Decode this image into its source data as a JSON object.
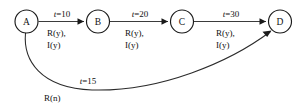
{
  "diagram": {
    "type": "state-transition-timing-diagram",
    "background_color": "#ffffff",
    "stroke_color": "#1a1a1a",
    "nodes": [
      {
        "id": "A",
        "label": "A",
        "cx": 26.5,
        "cy": 21.5,
        "r": 11.5
      },
      {
        "id": "B",
        "label": "B",
        "cx": 98.0,
        "cy": 21.5,
        "r": 11.5
      },
      {
        "id": "C",
        "label": "C",
        "cx": 182.0,
        "cy": 21.5,
        "r": 11.5
      },
      {
        "id": "D",
        "label": "D",
        "cx": 280.0,
        "cy": 21.5,
        "r": 11.5
      }
    ],
    "edges": [
      {
        "id": "a-to-b",
        "from": "A",
        "to": "B",
        "kind": "straight",
        "time_label": "t=10",
        "time_var": "t",
        "time_rest": "=10",
        "cond_line1": "R(y),",
        "cond_line2": "I(y)",
        "time_x": 62,
        "time_y": 17,
        "cond_x": 47,
        "cond_y1": 36,
        "cond_y2": 48
      },
      {
        "id": "b-to-c",
        "from": "B",
        "to": "C",
        "kind": "straight",
        "time_label": "t=20",
        "time_var": "t",
        "time_rest": "=20",
        "cond_line1": "R(y),",
        "cond_line2": "I(y)",
        "time_x": 140,
        "time_y": 17,
        "cond_x": 125,
        "cond_y1": 36,
        "cond_y2": 48
      },
      {
        "id": "c-to-d",
        "from": "C",
        "to": "D",
        "kind": "straight",
        "time_label": "t=30",
        "time_var": "t",
        "time_rest": "=30",
        "cond_line1": "R(y),",
        "cond_line2": "I(y)",
        "time_x": 231,
        "time_y": 17,
        "cond_x": 216,
        "cond_y1": 36,
        "cond_y2": 48
      },
      {
        "id": "a-to-d-curve",
        "from": "A",
        "to": "D",
        "kind": "curved",
        "time_label": "t=15",
        "time_var": "t",
        "time_rest": "=15",
        "cond_line1": "R(n)",
        "cond_line2": "",
        "time_x": 88,
        "time_y": 84,
        "cond_x": 44,
        "cond_y1": 101,
        "cond_y2": 0
      }
    ],
    "paths": {
      "edge_a_b": "M 38.5 21.5 L 84 21.5",
      "edge_b_c": "M 110 21.5 L 168 21.5",
      "edge_c_d": "M 194 21.5 L 266 21.5",
      "curve_a_d": "M 25.5 33 C 23 60 40 88 92 90 C 160 92 230 62 270.5 31.5",
      "arrow_a_b": "84,21.5 77.5,18.3 77.5,24.7",
      "arrow_b_c": "168,21.5 161.5,18.3 161.5,24.7",
      "arrow_c_d": "266,21.5 259.5,18.3 259.5,24.7",
      "arrow_a_d": "271.5,30.5 262.5,31.8 267.2,37.0"
    }
  }
}
